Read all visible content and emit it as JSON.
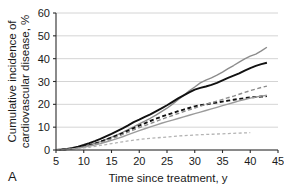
{
  "panel": {
    "label": "A"
  },
  "chart_data": {
    "type": "line",
    "title": "",
    "xlabel": "Time since treatment, y",
    "ylabel": "Cumulative incidence of cardiovascular disease, %",
    "xlim": [
      5,
      45
    ],
    "ylim": [
      0,
      60
    ],
    "xticks": [
      5,
      10,
      15,
      20,
      25,
      30,
      35,
      40,
      45
    ],
    "yticks": [
      0,
      10,
      20,
      30,
      40,
      50,
      60
    ],
    "xtick_labels": [
      "5",
      "10",
      "15",
      "20",
      "25",
      "30",
      "35",
      "40",
      "45"
    ],
    "ytick_labels": [
      "0",
      "10",
      "20",
      "30",
      "40",
      "50",
      "60"
    ],
    "grid": "horizontal",
    "legend": "none",
    "series": [
      {
        "name": "gray-solid-upper",
        "color": "#8c8c8c",
        "style": "solid",
        "width": 1.4,
        "x": [
          5,
          6,
          7,
          8,
          9,
          10,
          11,
          12,
          13,
          14,
          15,
          16,
          17,
          18,
          19,
          20,
          21,
          22,
          23,
          24,
          25,
          26,
          27,
          28,
          29,
          30,
          31,
          32,
          33,
          34,
          35,
          36,
          37,
          38,
          39,
          40,
          41,
          42,
          43
        ],
        "y": [
          0,
          0.2,
          0.4,
          0.7,
          1.1,
          1.6,
          2.2,
          2.9,
          3.7,
          4.6,
          5.6,
          6.6,
          7.7,
          8.9,
          10.1,
          11.4,
          12.6,
          13.9,
          15.3,
          16.8,
          18.3,
          20.1,
          22.0,
          23.9,
          25.9,
          27.6,
          29.4,
          30.6,
          31.6,
          32.8,
          34.1,
          35.6,
          37.0,
          38.5,
          39.9,
          41.1,
          42.0,
          43.4,
          45.0
        ]
      },
      {
        "name": "black-solid",
        "color": "#111111",
        "style": "solid",
        "width": 1.9,
        "x": [
          5,
          6,
          7,
          8,
          9,
          10,
          11,
          12,
          13,
          14,
          15,
          16,
          17,
          18,
          19,
          20,
          21,
          22,
          23,
          24,
          25,
          26,
          27,
          28,
          29,
          30,
          31,
          32,
          33,
          34,
          35,
          36,
          37,
          38,
          39,
          40,
          41,
          42,
          43
        ],
        "y": [
          0,
          0.2,
          0.5,
          0.9,
          1.5,
          2.2,
          3.0,
          3.9,
          4.9,
          6.0,
          7.1,
          8.3,
          9.5,
          10.8,
          12.2,
          13.3,
          14.5,
          15.6,
          16.9,
          18.2,
          19.6,
          21.1,
          22.6,
          23.9,
          25.2,
          26.4,
          27.2,
          27.8,
          28.5,
          29.4,
          30.5,
          31.6,
          32.6,
          33.6,
          34.8,
          35.9,
          36.8,
          37.6,
          38.2
        ]
      },
      {
        "name": "black-dashed",
        "color": "#111111",
        "style": "dashed",
        "width": 1.9,
        "x": [
          5,
          6,
          7,
          8,
          9,
          10,
          11,
          12,
          13,
          14,
          15,
          16,
          17,
          18,
          19,
          20,
          21,
          22,
          23,
          24,
          25,
          26,
          27,
          28,
          29,
          30,
          31,
          32,
          33,
          34,
          35,
          36,
          37,
          38,
          39,
          40,
          41,
          42,
          43
        ],
        "y": [
          0,
          0.1,
          0.3,
          0.6,
          1.0,
          1.5,
          2.1,
          2.8,
          3.6,
          4.5,
          5.4,
          6.4,
          7.4,
          8.5,
          9.6,
          10.7,
          11.7,
          12.7,
          13.7,
          14.6,
          15.4,
          16.2,
          17.0,
          17.7,
          18.4,
          19.1,
          19.6,
          20.0,
          20.4,
          20.8,
          21.2,
          21.6,
          22.0,
          22.4,
          22.7,
          23.0,
          23.2,
          23.4,
          23.6
        ]
      },
      {
        "name": "gray-dashed-upper",
        "color": "#8c8c8c",
        "style": "dashed",
        "width": 1.4,
        "x": [
          5,
          6,
          7,
          8,
          9,
          10,
          11,
          12,
          13,
          14,
          15,
          16,
          17,
          18,
          19,
          20,
          21,
          22,
          23,
          24,
          25,
          26,
          27,
          28,
          29,
          30,
          31,
          32,
          33,
          34,
          35,
          36,
          37,
          38,
          39,
          40,
          41,
          42,
          43
        ],
        "y": [
          0,
          0.1,
          0.3,
          0.5,
          0.9,
          1.3,
          1.9,
          2.5,
          3.2,
          4.0,
          4.9,
          5.8,
          6.8,
          7.8,
          8.8,
          9.8,
          10.7,
          11.6,
          12.5,
          13.4,
          14.3,
          15.1,
          16.0,
          16.8,
          17.6,
          18.4,
          19.2,
          20.0,
          20.7,
          21.4,
          22.1,
          22.9,
          23.6,
          24.4,
          25.2,
          26.0,
          26.7,
          27.4,
          28.0
        ]
      },
      {
        "name": "gray-solid-lower",
        "color": "#9b9b9b",
        "style": "solid",
        "width": 1.4,
        "x": [
          5,
          6,
          7,
          8,
          9,
          10,
          11,
          12,
          13,
          14,
          15,
          16,
          17,
          18,
          19,
          20,
          21,
          22,
          23,
          24,
          25,
          26,
          27,
          28,
          29,
          30,
          31,
          32,
          33,
          34,
          35,
          36,
          37,
          38,
          39,
          40,
          41,
          42,
          43
        ],
        "y": [
          0,
          0.1,
          0.3,
          0.5,
          0.8,
          1.2,
          1.7,
          2.2,
          2.8,
          3.5,
          4.2,
          5.0,
          5.8,
          6.7,
          7.6,
          8.5,
          9.3,
          10.1,
          10.9,
          11.7,
          12.4,
          13.1,
          13.8,
          14.5,
          15.2,
          15.9,
          16.6,
          17.3,
          18.0,
          18.7,
          19.4,
          20.1,
          20.8,
          21.5,
          22.1,
          22.7,
          23.2,
          23.6,
          24.0
        ]
      },
      {
        "name": "light-gray-dashed-lowest",
        "color": "#b3b3b3",
        "style": "dashed-fine",
        "width": 1.3,
        "x": [
          5,
          6,
          7,
          8,
          9,
          10,
          11,
          12,
          13,
          14,
          15,
          16,
          17,
          18,
          19,
          20,
          21,
          22,
          23,
          24,
          25,
          26,
          27,
          28,
          29,
          30,
          31,
          32,
          33,
          34,
          35,
          36,
          37,
          38,
          39,
          40
        ],
        "y": [
          0,
          0.1,
          0.2,
          0.4,
          0.6,
          0.9,
          1.2,
          1.6,
          2.0,
          2.4,
          2.8,
          3.2,
          3.6,
          4.0,
          4.3,
          4.6,
          4.9,
          5.1,
          5.3,
          5.5,
          5.7,
          5.9,
          6.1,
          6.3,
          6.4,
          6.6,
          6.7,
          6.8,
          6.9,
          7.0,
          7.1,
          7.2,
          7.3,
          7.4,
          7.5,
          7.6
        ]
      }
    ]
  }
}
